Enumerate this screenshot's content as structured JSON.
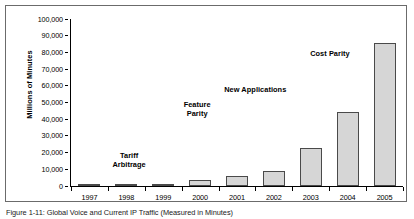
{
  "figure": {
    "caption": "Figure 1-11: Global Voice and Current IP Traffic (Measured in Minutes)"
  },
  "chart_data": {
    "type": "bar",
    "title": "",
    "xlabel": "",
    "ylabel": "Millions of Minutes",
    "ylim": [
      0,
      100000
    ],
    "ytick_step": 10000,
    "grid": false,
    "legend": "none",
    "bar_fill_color": "#d6d6d6",
    "bar_border_color": "#4a4a4a",
    "categories": [
      "1997",
      "1998",
      "1999",
      "2000",
      "2001",
      "2002",
      "2003",
      "2004",
      "2005"
    ],
    "values": [
      500,
      1000,
      1500,
      3800,
      5800,
      9000,
      22500,
      44500,
      85500
    ],
    "ytick_labels": [
      "0",
      "10,000",
      "20,000",
      "30,000",
      "40,000",
      "50,000",
      "60,000",
      "70,000",
      "80,000",
      "90,000",
      "100,000"
    ],
    "annotations": [
      {
        "text": "Tariff\nArbitrage",
        "x_pct": 17.5,
        "y_pct": 79.0
      },
      {
        "text": "Feature\nParity",
        "x_pct": 38.0,
        "y_pct": 48.5
      },
      {
        "text": "New Applications",
        "x_pct": 55.5,
        "y_pct": 39.5
      },
      {
        "text": "Cost Parity",
        "x_pct": 78.0,
        "y_pct": 18.0
      }
    ]
  }
}
